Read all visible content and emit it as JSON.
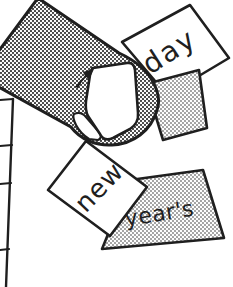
{
  "cards": [
    {
      "label": "day",
      "tone": "white"
    },
    {
      "label": "new",
      "tone": "white"
    },
    {
      "label": "year's",
      "tone": "gray"
    },
    {
      "label": "",
      "tone": "gray"
    }
  ],
  "colors": {
    "outline": "#1f1f1f",
    "thumb_gray": "#9e9e9e",
    "card_gray": "#c9c9c9",
    "background": "#ffffff"
  }
}
